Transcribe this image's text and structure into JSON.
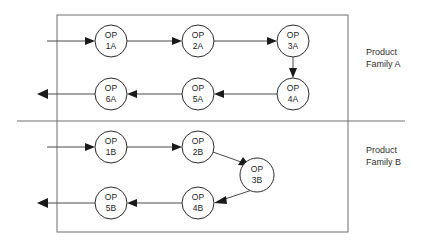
{
  "diagram": {
    "outer_box": {
      "x": 57,
      "y": 15,
      "width": 291,
      "height": 217
    },
    "divider": {
      "x1": 17,
      "y1": 121,
      "x2": 405,
      "y2": 121
    },
    "groups": [
      {
        "id": "family-a",
        "label_line1": "Product",
        "label_line2": "Family A",
        "label_x": 366,
        "label_y1": 52,
        "label_y2": 64
      },
      {
        "id": "family-b",
        "label_line1": "Product",
        "label_line2": "Family B",
        "label_x": 366,
        "label_y1": 150,
        "label_y2": 162
      }
    ],
    "nodes": [
      {
        "id": "op-1a",
        "line1": "OP",
        "line2": "1A",
        "cx": 111,
        "cy": 41,
        "r": 16
      },
      {
        "id": "op-2a",
        "line1": "OP",
        "line2": "2A",
        "cx": 198,
        "cy": 41,
        "r": 16
      },
      {
        "id": "op-3a",
        "line1": "OP",
        "line2": "3A",
        "cx": 293,
        "cy": 41,
        "r": 16
      },
      {
        "id": "op-4a",
        "line1": "OP",
        "line2": "4A",
        "cx": 293,
        "cy": 94,
        "r": 16
      },
      {
        "id": "op-5a",
        "line1": "OP",
        "line2": "5A",
        "cx": 198,
        "cy": 94,
        "r": 16
      },
      {
        "id": "op-6a",
        "line1": "OP",
        "line2": "6A",
        "cx": 111,
        "cy": 94,
        "r": 16
      },
      {
        "id": "op-1b",
        "line1": "OP",
        "line2": "1B",
        "cx": 111,
        "cy": 147,
        "r": 16
      },
      {
        "id": "op-2b",
        "line1": "OP",
        "line2": "2B",
        "cx": 198,
        "cy": 147,
        "r": 16
      },
      {
        "id": "op-3b",
        "line1": "OP",
        "line2": "3B",
        "cx": 257,
        "cy": 175,
        "r": 17
      },
      {
        "id": "op-4b",
        "line1": "OP",
        "line2": "4B",
        "cx": 198,
        "cy": 203,
        "r": 16
      },
      {
        "id": "op-5b",
        "line1": "OP",
        "line2": "5B",
        "cx": 111,
        "cy": 203,
        "r": 16
      }
    ],
    "edges": [
      {
        "id": "edge-input-a",
        "from": "input",
        "to": "op-1a"
      },
      {
        "id": "edge-1a-2a",
        "from": "op-1a",
        "to": "op-2a"
      },
      {
        "id": "edge-2a-3a",
        "from": "op-2a",
        "to": "op-3a"
      },
      {
        "id": "edge-3a-4a",
        "from": "op-3a",
        "to": "op-4a"
      },
      {
        "id": "edge-4a-5a",
        "from": "op-4a",
        "to": "op-5a"
      },
      {
        "id": "edge-5a-6a",
        "from": "op-5a",
        "to": "op-6a"
      },
      {
        "id": "edge-6a-output",
        "from": "op-6a",
        "to": "output"
      },
      {
        "id": "edge-input-b",
        "from": "input",
        "to": "op-1b"
      },
      {
        "id": "edge-1b-2b",
        "from": "op-1b",
        "to": "op-2b"
      },
      {
        "id": "edge-2b-3b",
        "from": "op-2b",
        "to": "op-3b"
      },
      {
        "id": "edge-3b-4b",
        "from": "op-3b",
        "to": "op-4b"
      },
      {
        "id": "edge-4b-5b",
        "from": "op-4b",
        "to": "op-5b"
      },
      {
        "id": "edge-5b-output",
        "from": "op-5b",
        "to": "output"
      }
    ],
    "colors": {
      "background": "#ffffff",
      "node_stroke": "#2b2b2b",
      "flow_line": "#4a4a4a",
      "box_line": "#6e6e6e",
      "text": "#1a1a1a",
      "label_text": "#303030"
    }
  }
}
